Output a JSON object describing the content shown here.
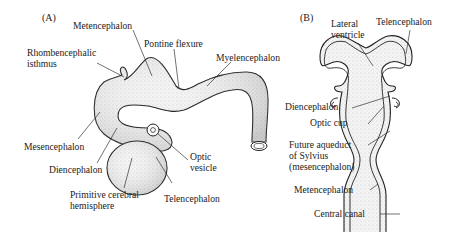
{
  "figure": {
    "panel_a": {
      "label": "(A)",
      "annotations": {
        "metencephalon": "Metencephalon",
        "pontine_flexure": "Pontine flexure",
        "rhombencephalic_isthmus_line1": "Rhombencephalic",
        "rhombencephalic_isthmus_line2": "isthmus",
        "myelencephalon": "Myelencephalon",
        "mesencephalon": "Mesencephalon",
        "diencephalon": "Diencephalon",
        "optic_vesicle_line1": "Optic",
        "optic_vesicle_line2": "vesicle",
        "primitive_cerebral_hemisphere_line1": "Primitive cerebral",
        "primitive_cerebral_hemisphere_line2": "hemisphere",
        "telencephalon": "Telencephalon"
      }
    },
    "panel_b": {
      "label": "(B)",
      "annotations": {
        "lateral_ventricle_line1": "Lateral",
        "lateral_ventricle_line2": "ventricle",
        "telencephalon": "Telencephalon",
        "diencephalon": "Diencephalon",
        "optic_cup": "Optic cup",
        "future_aqueduct_line1": "Future aqueduct",
        "future_aqueduct_line2": "of Sylvius",
        "future_aqueduct_line3": "(mesencephalon)",
        "metencephalon": "Metencephalon",
        "central_canal": "Central canal"
      }
    }
  }
}
